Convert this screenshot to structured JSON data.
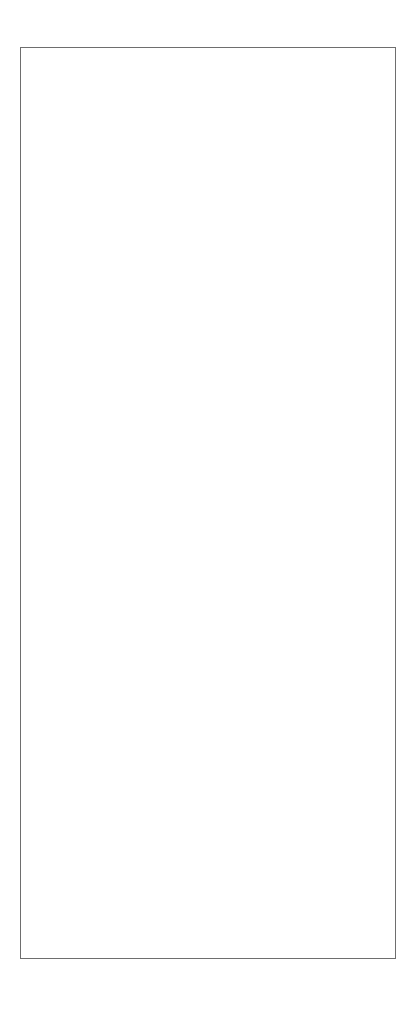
{
  "figure": {
    "outer_border_color": "#6e6e6e",
    "background_color": "#ffffff",
    "ink_color": "#0a0a0a",
    "caption": "Fig. 9.2 The first evidence for the new particle."
  },
  "axis": {
    "y_label": "Weighted combinations/20 MeV",
    "x_label": "Mass (GeV)"
  },
  "annotations": {
    "top_label": "New particle",
    "bottom_label": "New particle"
  },
  "chart_data": [
    {
      "type": "scatter",
      "panel": "top",
      "title": "",
      "xlabel": "Mass (GeV)",
      "ylabel": "Weighted combinations/20 MeV",
      "xlim": [
        1.59,
        2.215
      ],
      "ylim": [
        0,
        90
      ],
      "xticks": [
        1.6,
        1.8,
        2.0,
        2.2
      ],
      "xticklabels": [
        "1.6",
        "1.8",
        "2.0",
        "2.2"
      ],
      "xminorticks": [
        1.65,
        1.7,
        1.75,
        1.85,
        1.9,
        1.95,
        2.05,
        2.1,
        2.15
      ],
      "yticks": [
        0,
        20,
        40,
        60,
        80
      ],
      "yticklabels": [
        "0",
        "20",
        "40",
        "60",
        "80"
      ],
      "grid": false,
      "legend": "none",
      "errorbars": "y",
      "annotation": {
        "text": "New particle",
        "points_to_x": 1.875,
        "points_to_y": 58
      },
      "x": [
        1.605,
        1.625,
        1.645,
        1.665,
        1.685,
        1.705,
        1.725,
        1.745,
        1.765,
        1.785,
        1.805,
        1.825,
        1.845,
        1.865,
        1.885,
        1.905,
        1.925,
        1.945,
        1.965,
        1.985,
        2.005,
        2.025,
        2.045,
        2.065,
        2.085,
        2.105,
        2.125,
        2.145,
        2.165,
        2.185,
        2.2
      ],
      "y": [
        74,
        80,
        69,
        62.5,
        59,
        53.5,
        51.5,
        43.5,
        49,
        39.5,
        33.5,
        38.5,
        51.5,
        56,
        51,
        35.5,
        30,
        27.5,
        26.5,
        29,
        22.5,
        20.5,
        20.5,
        16,
        14,
        16,
        16,
        15.5,
        15,
        13.5,
        12.5
      ],
      "yerr": [
        7,
        7,
        6.5,
        6,
        6,
        6,
        6,
        5.5,
        5.5,
        5,
        4.5,
        5,
        5.5,
        5.5,
        5.5,
        4.5,
        4,
        4,
        3.5,
        4,
        3,
        3,
        3,
        2.5,
        2.5,
        2.5,
        2.5,
        2.5,
        2.5,
        2,
        2
      ]
    },
    {
      "type": "scatter",
      "panel": "bottom",
      "title": "",
      "xlabel": "Mass (GeV)",
      "ylabel": "Weighted combinations/20 MeV",
      "xlim": [
        1.59,
        2.215
      ],
      "ylim": [
        0,
        450
      ],
      "xticks": [
        1.6,
        1.8,
        2.0,
        2.2
      ],
      "xticklabels": [
        "1.6",
        "1.8",
        "2.0",
        "2.2"
      ],
      "xminorticks": [
        1.65,
        1.7,
        1.75,
        1.85,
        1.9,
        1.95,
        2.05,
        2.1,
        2.15
      ],
      "yticks": [
        0,
        100,
        200,
        300,
        400
      ],
      "yticklabels": [
        "0",
        "100",
        "200",
        "300",
        "400"
      ],
      "grid": false,
      "legend": "none",
      "errorbars": "y",
      "annotation": {
        "text": "New particle",
        "points_to_x": 1.865,
        "points_to_y": 250
      },
      "x": [
        1.6,
        1.615,
        1.63,
        1.645,
        1.66,
        1.675,
        1.69,
        1.705,
        1.72,
        1.735,
        1.75,
        1.765,
        1.78,
        1.795,
        1.81,
        1.825,
        1.84,
        1.855,
        1.87,
        1.89,
        1.91,
        1.93,
        1.95,
        1.965,
        1.98,
        1.995,
        2.01,
        2.025,
        2.04,
        2.055,
        2.07,
        2.085,
        2.1,
        2.115,
        2.13,
        2.145,
        2.16,
        2.175,
        2.19
      ],
      "y": [
        160,
        178,
        155,
        153,
        163,
        157,
        177,
        156,
        141,
        163,
        152,
        177,
        205,
        220,
        150,
        128,
        163,
        150,
        136,
        152,
        150,
        150,
        128,
        116,
        117,
        119,
        120,
        91,
        100,
        113,
        98,
        160,
        155,
        150,
        145,
        140,
        130,
        120,
        110
      ],
      "yerr": [
        13,
        12,
        11,
        11,
        11,
        11,
        12,
        11,
        10,
        11,
        11,
        12,
        13,
        13,
        11,
        10,
        11,
        11,
        10,
        11,
        11,
        11,
        10,
        10,
        10,
        10,
        10,
        9,
        9,
        10,
        9,
        11,
        11,
        11,
        11,
        10,
        10,
        10,
        10
      ]
    }
  ]
}
